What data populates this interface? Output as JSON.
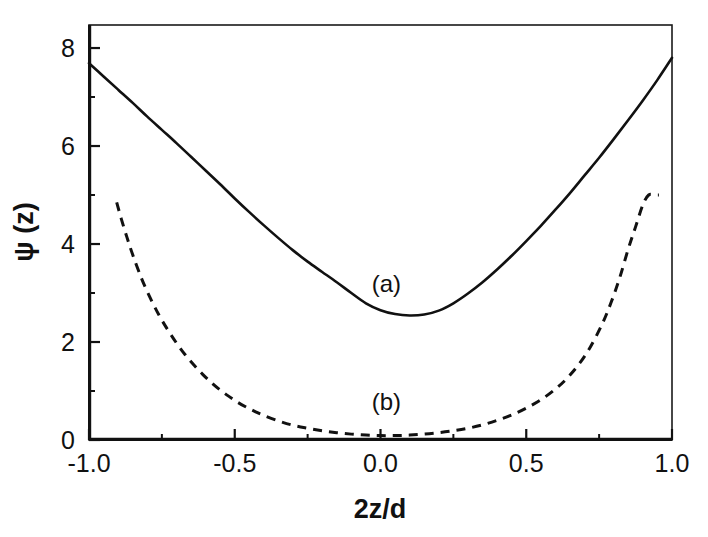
{
  "chart_data": {
    "type": "line",
    "title": "",
    "xlabel": "2z/d",
    "ylabel": "ψ (z)",
    "xlim": [
      -1.0,
      1.0
    ],
    "ylim": [
      0.0,
      8.47
    ],
    "grid": false,
    "legend_position": "inline-annotation",
    "xticks": [
      -1.0,
      -0.5,
      0.0,
      0.5,
      1.0
    ],
    "xtick_labels": [
      "-1.0",
      "-0.5",
      "0.0",
      "0.5",
      "1.0"
    ],
    "xticks_minor": [
      -0.75,
      -0.25,
      0.25,
      0.75
    ],
    "yticks": [
      0,
      2,
      4,
      6,
      8
    ],
    "ytick_labels": [
      "0",
      "2",
      "4",
      "6",
      "8"
    ],
    "yticks_minor": [
      1,
      3,
      5,
      7
    ],
    "series": [
      {
        "name": "(a)",
        "style": "solid",
        "annotation": "(a)",
        "annotation_x": 0.02,
        "annotation_y": 3.02,
        "x": [
          -1.0,
          -0.95,
          -0.9,
          -0.85,
          -0.8,
          -0.75,
          -0.7,
          -0.65,
          -0.6,
          -0.55,
          -0.5,
          -0.45,
          -0.4,
          -0.35,
          -0.3,
          -0.25,
          -0.2,
          -0.15,
          -0.1,
          -0.05,
          0.0,
          0.05,
          0.1,
          0.15,
          0.2,
          0.25,
          0.3,
          0.35,
          0.4,
          0.45,
          0.5,
          0.55,
          0.6,
          0.65,
          0.7,
          0.75,
          0.8,
          0.85,
          0.9,
          0.95,
          1.0
        ],
        "y": [
          7.69,
          7.42,
          7.15,
          6.88,
          6.6,
          6.33,
          6.06,
          5.78,
          5.5,
          5.22,
          4.93,
          4.65,
          4.38,
          4.12,
          3.87,
          3.64,
          3.43,
          3.22,
          3.0,
          2.79,
          2.65,
          2.57,
          2.54,
          2.56,
          2.64,
          2.79,
          2.99,
          3.22,
          3.48,
          3.76,
          4.06,
          4.37,
          4.7,
          5.04,
          5.4,
          5.76,
          6.14,
          6.53,
          6.93,
          7.35,
          7.8
        ]
      },
      {
        "name": "(b)",
        "style": "dashed",
        "annotation": "(b)",
        "annotation_x": 0.02,
        "annotation_y": 0.62,
        "x": [
          -0.905,
          -0.89,
          -0.87,
          -0.85,
          -0.82,
          -0.79,
          -0.76,
          -0.73,
          -0.7,
          -0.67,
          -0.64,
          -0.61,
          -0.58,
          -0.55,
          -0.52,
          -0.49,
          -0.46,
          -0.43,
          -0.4,
          -0.35,
          -0.3,
          -0.25,
          -0.2,
          -0.15,
          -0.1,
          -0.05,
          0.0,
          0.05,
          0.1,
          0.15,
          0.2,
          0.25,
          0.3,
          0.35,
          0.4,
          0.45,
          0.5,
          0.55,
          0.6,
          0.64,
          0.68,
          0.72,
          0.76,
          0.79,
          0.82,
          0.85,
          0.875,
          0.9,
          0.92,
          0.94,
          0.955
        ],
        "y": [
          4.85,
          4.53,
          4.14,
          3.78,
          3.3,
          2.9,
          2.55,
          2.25,
          1.98,
          1.74,
          1.53,
          1.34,
          1.17,
          1.02,
          0.89,
          0.77,
          0.67,
          0.58,
          0.5,
          0.39,
          0.3,
          0.24,
          0.19,
          0.15,
          0.12,
          0.1,
          0.09,
          0.09,
          0.1,
          0.12,
          0.15,
          0.19,
          0.24,
          0.31,
          0.4,
          0.51,
          0.65,
          0.82,
          1.04,
          1.26,
          1.54,
          1.9,
          2.36,
          2.79,
          3.3,
          3.9,
          4.35,
          4.8,
          5.0,
          5.0,
          5.0
        ]
      }
    ]
  }
}
